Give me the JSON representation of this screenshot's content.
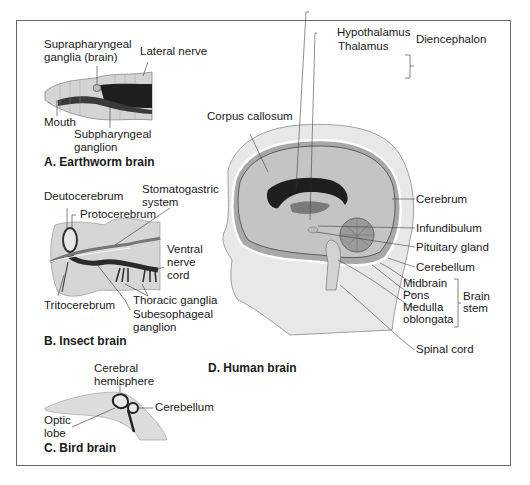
{
  "figure": {
    "panels": [
      {
        "id": "A",
        "caption": "A. Earthworm brain",
        "labels": {
          "suprapharyngeal_1": "Suprapharyngeal",
          "suprapharyngeal_2": "ganglia (brain)",
          "lateral_nerve": "Lateral nerve",
          "mouth": "Mouth",
          "subpharyngeal_1": "Subpharyngeal",
          "subpharyngeal_2": "ganglion"
        }
      },
      {
        "id": "B",
        "caption": "B. Insect brain",
        "labels": {
          "deutocerebrum": "Deutocerebrum",
          "protocerebrum": "Protocerebrum",
          "stomatogastric_1": "Stomatogastric",
          "stomatogastric_2": "system",
          "ventral_1": "Ventral",
          "ventral_2": "nerve",
          "ventral_3": "cord",
          "tritocerebrum": "Tritocerebrum",
          "thoracic_ganglia": "Thoracic ganglia",
          "subesophageal_1": "Subesophageal",
          "subesophageal_2": "ganglion"
        }
      },
      {
        "id": "C",
        "caption": "C. Bird brain",
        "labels": {
          "cerebral_1": "Cerebral",
          "cerebral_2": "hemisphere",
          "cerebellum": "Cerebellum",
          "optic_1": "Optic",
          "optic_2": "lobe"
        }
      },
      {
        "id": "D",
        "caption": "D. Human brain",
        "labels": {
          "hypothalamus": "Hypothalamus",
          "thalamus": "Thalamus",
          "diencephalon": "Diencephalon",
          "corpus_callosum": "Corpus callosum",
          "cerebrum": "Cerebrum",
          "infundibulum": "Infundibulum",
          "pituitary_gland": "Pituitary gland",
          "cerebellum": "Cerebellum",
          "midbrain": "Midbrain",
          "pons": "Pons",
          "medulla_1": "Medulla",
          "medulla_2": "oblongata",
          "brain_stem_1": "Brain",
          "brain_stem_2": "stem",
          "spinal_cord": "Spinal cord"
        }
      }
    ]
  }
}
